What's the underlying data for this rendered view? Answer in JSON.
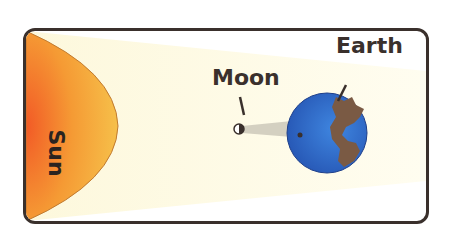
{
  "diagram": {
    "labels": {
      "sun": "Sun",
      "moon": "Moon",
      "earth": "Earth"
    },
    "colors": {
      "frame_border": "#3a302c",
      "sunlight": "#fdfbe6",
      "sun_outer": "#f4b23c",
      "sun_inner": "#f26a2a",
      "earth_ocean": "#2f63c8",
      "earth_land": "#7a5a44",
      "moon_shadow": "#c9c6b8"
    }
  }
}
